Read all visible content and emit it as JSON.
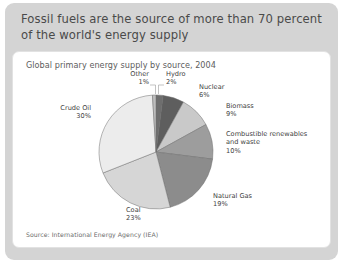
{
  "header": {
    "title": "Fossil fuels are the source of more than 70 percent of the world's energy supply"
  },
  "card": {
    "chart_title": "Global primary energy supply by source, 2004",
    "source": "Source: International Energy Agency (IEA)"
  },
  "chart_data": {
    "type": "pie",
    "title": "Global primary energy supply by source, 2004",
    "units": "percent of total primary energy supply",
    "start_angle_deg": -90,
    "direction": "clockwise",
    "categories": [
      "Hydro",
      "Nuclear",
      "Biomass",
      "Combustible renewables and waste",
      "Natural Gas",
      "Coal",
      "Crude Oil",
      "Other"
    ],
    "values": [
      2,
      6,
      9,
      10,
      19,
      23,
      30,
      1
    ],
    "slices": [
      {
        "label": "Hydro",
        "value": 2,
        "display": "2%",
        "color": "#6e6e6e",
        "label_x": 153,
        "label_y": 6,
        "anchor": "start",
        "leader": "M 145.5,24 L 145.5,15 L 151,15"
      },
      {
        "label": "Nuclear",
        "value": 6,
        "display": "6%",
        "color": "#5e5e5e",
        "label_x": 186,
        "label_y": 19,
        "anchor": "start",
        "leader": ""
      },
      {
        "label": "Biomass",
        "value": 9,
        "display": "9%",
        "color": "#c9c9c9",
        "label_x": 213,
        "label_y": 38,
        "anchor": "start",
        "leader": ""
      },
      {
        "label": "Combustible renewables",
        "label2": "and waste",
        "value": 10,
        "display": "10%",
        "color": "#9d9d9d",
        "label_x": 213,
        "label_y": 66,
        "anchor": "start",
        "leader": ""
      },
      {
        "label": "Natural Gas",
        "value": 19,
        "display": "19%",
        "color": "#8c8c8c",
        "label_x": 200,
        "label_y": 128,
        "anchor": "start",
        "leader": ""
      },
      {
        "label": "Coal",
        "value": 23,
        "display": "23%",
        "color": "#d6d6d6",
        "label_x": 113,
        "label_y": 142,
        "anchor": "start",
        "leader": ""
      },
      {
        "label": "Crude Oil",
        "value": 30,
        "display": "30%",
        "color": "#ececec",
        "label_x": 78,
        "label_y": 40,
        "anchor": "end",
        "leader": ""
      },
      {
        "label": "Other",
        "value": 1,
        "display": "1%",
        "color": "#bdbdbd",
        "label_x": 136,
        "label_y": 6,
        "anchor": "end",
        "leader": "M 142.5,24 L 142.5,15 L 137,15"
      }
    ],
    "geometry": {
      "cx": 143,
      "cy": 82,
      "r": 57
    }
  }
}
